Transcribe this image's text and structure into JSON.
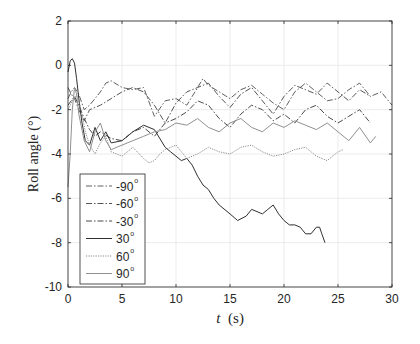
{
  "chart_data": {
    "type": "line",
    "title": "",
    "xlabel": "t (s)",
    "ylabel": "Roll angle (°)",
    "xlim": [
      0,
      30
    ],
    "ylim": [
      -10,
      2
    ],
    "xticks": [
      0,
      5,
      10,
      15,
      20,
      25,
      30
    ],
    "yticks": [
      2,
      0,
      -2,
      -4,
      -6,
      -8,
      -10
    ],
    "grid": true,
    "legend_position": "lower left",
    "series": [
      {
        "name": "-90°",
        "style": "dashdot",
        "color": "#606060",
        "x": [
          0,
          0.3,
          0.6,
          1.0,
          1.5,
          2.0,
          2.5,
          3.0,
          3.5,
          4.0,
          5.0,
          6.0,
          7.0,
          8.0,
          9.0,
          10.0,
          11.0,
          12.0,
          12.5,
          13.0,
          14.0,
          15.0,
          16.0,
          17.0,
          18.0,
          19.0,
          20.0,
          21.0,
          22.0,
          23.0,
          24.0,
          25.0,
          26.0,
          27.0,
          28.0,
          29.0,
          30.0
        ],
        "y": [
          -1.5,
          -1.2,
          -1.0,
          -1.3,
          -2.0,
          -1.8,
          -1.5,
          -1.2,
          -0.8,
          -0.7,
          -1.0,
          -1.1,
          -1.0,
          -2.3,
          -1.6,
          -1.5,
          -1.8,
          -1.0,
          -0.6,
          -0.9,
          -1.2,
          -1.5,
          -1.1,
          -0.9,
          -1.3,
          -1.7,
          -2.0,
          -1.2,
          -0.8,
          -1.2,
          -1.6,
          -1.5,
          -1.1,
          -0.8,
          -1.4,
          -1.2,
          -1.8
        ]
      },
      {
        "name": "-60°",
        "style": "dashdot",
        "color": "#555555",
        "x": [
          0,
          0.3,
          0.6,
          1.0,
          1.5,
          2.0,
          3.0,
          4.0,
          5.0,
          6.0,
          7.0,
          8.0,
          9.0,
          10.0,
          11.0,
          12.0,
          13.0,
          14.0,
          15.0,
          16.0,
          17.0,
          18.0,
          19.0,
          20.0,
          21.0,
          22.0,
          23.0,
          24.0,
          25.0,
          26.0,
          27.0,
          28.0
        ],
        "y": [
          -1.0,
          -1.3,
          -1.5,
          -2.0,
          -2.5,
          -2.0,
          -1.8,
          -1.5,
          -1.2,
          -1.0,
          -1.2,
          -1.8,
          -2.6,
          -1.7,
          -1.2,
          -1.0,
          -0.8,
          -1.4,
          -1.9,
          -1.3,
          -1.0,
          -1.6,
          -2.2,
          -1.4,
          -0.9,
          -1.1,
          -1.3,
          -0.8,
          -1.2,
          -1.6,
          -1.1,
          -1.4
        ]
      },
      {
        "name": "-30°",
        "style": "dashdot",
        "color": "#4a4a4a",
        "x": [
          0,
          0.3,
          0.6,
          1.0,
          1.5,
          2.0,
          2.5,
          3.0,
          4.0,
          5.0,
          6.0,
          7.0,
          8.0,
          9.0,
          10.0,
          11.0,
          12.0,
          13.0,
          14.0,
          15.0,
          16.0,
          17.0,
          18.0,
          19.0,
          20.0,
          21.0,
          22.0,
          23.0,
          24.0,
          25.0,
          26.0,
          27.0,
          28.0
        ],
        "y": [
          -1.8,
          -1.6,
          -1.4,
          -1.8,
          -2.4,
          -2.9,
          -3.2,
          -3.0,
          -3.3,
          -3.4,
          -3.0,
          -2.8,
          -3.2,
          -2.6,
          -2.4,
          -2.1,
          -1.6,
          -1.8,
          -2.4,
          -2.8,
          -2.2,
          -1.8,
          -2.0,
          -2.5,
          -2.2,
          -2.6,
          -2.0,
          -1.8,
          -2.3,
          -2.6,
          -2.3,
          -2.0,
          -2.6
        ]
      },
      {
        "name": "30°",
        "style": "solid",
        "color": "#303030",
        "x": [
          0,
          0.2,
          0.4,
          0.6,
          0.8,
          1.0,
          1.3,
          1.6,
          2.0,
          2.5,
          3.0,
          3.5,
          4.0,
          5.0,
          6.0,
          7.0,
          8.0,
          9.0,
          9.5,
          10.0,
          10.5,
          11.0,
          11.5,
          12.0,
          12.5,
          13.0,
          13.5,
          14.0,
          15.0,
          15.7,
          16.5,
          17.0,
          17.5,
          18.0,
          18.5,
          19.0,
          19.5,
          20.0,
          20.5,
          21.0,
          21.5,
          22.0,
          22.5,
          23.0,
          23.3,
          23.5,
          23.8
        ],
        "y": [
          -0.3,
          0.2,
          0.3,
          0.1,
          -0.6,
          -1.5,
          -2.6,
          -3.4,
          -3.6,
          -2.8,
          -3.4,
          -3.0,
          -3.5,
          -3.4,
          -3.0,
          -2.7,
          -2.9,
          -3.7,
          -3.9,
          -4.1,
          -4.3,
          -4.2,
          -4.5,
          -5.0,
          -5.4,
          -5.6,
          -6.0,
          -6.3,
          -6.7,
          -7.0,
          -6.8,
          -6.5,
          -6.6,
          -6.7,
          -6.5,
          -6.3,
          -6.7,
          -7.0,
          -7.2,
          -7.2,
          -7.3,
          -7.6,
          -7.6,
          -7.3,
          -7.3,
          -7.6,
          -8.0
        ]
      },
      {
        "name": "60°",
        "style": "dotted",
        "color": "#8a8a8a",
        "x": [
          0,
          0.4,
          0.8,
          1.2,
          1.6,
          2.0,
          2.5,
          3.0,
          3.5,
          4.0,
          5.0,
          6.0,
          7.0,
          7.5,
          8.0,
          8.5,
          9.0,
          10.0,
          11.0,
          12.0,
          13.0,
          14.0,
          15.0,
          16.0,
          17.0,
          18.0,
          19.0,
          20.0,
          21.0,
          22.0,
          23.0,
          24.0,
          25.0,
          25.5
        ],
        "y": [
          -2.0,
          -1.6,
          -1.3,
          -2.0,
          -3.0,
          -3.6,
          -4.0,
          -3.5,
          -3.2,
          -3.9,
          -4.1,
          -3.7,
          -4.2,
          -4.4,
          -4.3,
          -4.0,
          -3.8,
          -3.6,
          -4.2,
          -4.0,
          -3.7,
          -3.9,
          -4.0,
          -3.7,
          -3.6,
          -3.9,
          -4.1,
          -4.0,
          -3.8,
          -3.7,
          -4.1,
          -4.3,
          -3.9,
          -3.8
        ]
      },
      {
        "name": "90°",
        "style": "solid",
        "color": "#909090",
        "x": [
          0,
          0.2,
          0.4,
          0.6,
          0.8,
          1.0,
          1.5,
          2.0,
          2.5,
          3.0,
          3.5,
          4.0,
          5.0,
          6.0,
          7.0,
          8.0,
          9.0,
          10.0,
          11.0,
          12.0,
          13.0,
          14.0,
          15.0,
          16.0,
          17.0,
          18.0,
          19.0,
          20.0,
          21.0,
          22.0,
          23.0,
          24.0,
          25.0,
          26.0,
          27.0,
          28.0,
          28.5
        ],
        "y": [
          -5.5,
          -4.0,
          -2.0,
          -1.0,
          -1.3,
          -2.2,
          -3.4,
          -3.9,
          -3.0,
          -2.6,
          -3.4,
          -3.8,
          -3.6,
          -3.4,
          -3.2,
          -3.0,
          -2.9,
          -2.6,
          -2.7,
          -2.4,
          -2.8,
          -3.0,
          -2.6,
          -2.4,
          -2.8,
          -3.0,
          -2.6,
          -2.8,
          -2.5,
          -2.7,
          -2.9,
          -2.6,
          -3.0,
          -3.4,
          -2.8,
          -3.5,
          -3.2
        ]
      }
    ]
  },
  "axes": {
    "xlabel_italic": "t",
    "xlabel_unit": "(s)",
    "ylabel": "Roll angle (°)"
  },
  "legend": {
    "items": [
      {
        "label": "-90",
        "sup": "o"
      },
      {
        "label": "-60",
        "sup": "o"
      },
      {
        "label": "-30",
        "sup": "o"
      },
      {
        "label": "30",
        "sup": "o"
      },
      {
        "label": "60",
        "sup": "o"
      },
      {
        "label": "90",
        "sup": "o"
      }
    ]
  }
}
